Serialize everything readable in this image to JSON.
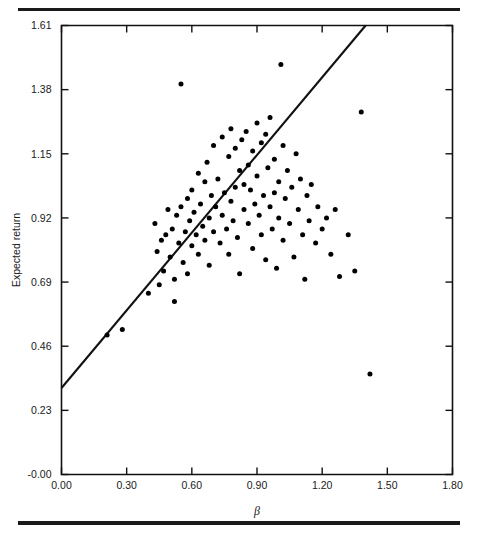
{
  "figure": {
    "background": "#ffffff",
    "ink_color": "#111111",
    "rules": {
      "top_label": "top-horizontal-rule",
      "bottom_label": "bottom-horizontal-rule"
    }
  },
  "chart_data": {
    "type": "scatter",
    "title": "",
    "subtitle": "",
    "xlabel": "β",
    "ylabel": "Expected return",
    "xlim": [
      0.0,
      1.8
    ],
    "ylim": [
      0.0,
      1.61
    ],
    "grid": false,
    "legend": null,
    "xticks": [
      0.0,
      0.3,
      0.6,
      0.9,
      1.2,
      1.5,
      1.8
    ],
    "xticklabels": [
      "0.00",
      "0.30",
      "0.60",
      "0.90",
      "1.20",
      "1.50",
      "1.80"
    ],
    "yticks": [
      0.0,
      0.23,
      0.46,
      0.69,
      0.92,
      1.15,
      1.38,
      1.61
    ],
    "yticklabels": [
      "-0.00",
      "0.23",
      "0.46",
      "0.69",
      "0.92",
      "1.15",
      "1.38",
      "1.61"
    ],
    "marker": {
      "shape": "circle",
      "color": "#000000",
      "size_px": 5
    },
    "fit_line": {
      "name": "security-market-line",
      "color": "#111111",
      "x_start": 0.0,
      "y_start": 0.31,
      "x_end": 1.4,
      "y_end": 1.61,
      "slope": 0.929,
      "intercept": 0.31
    },
    "series": [
      {
        "name": "securities",
        "n_points": 110,
        "points": [
          [
            0.21,
            0.5
          ],
          [
            0.28,
            0.52
          ],
          [
            0.4,
            0.65
          ],
          [
            0.43,
            0.9
          ],
          [
            0.44,
            0.8
          ],
          [
            0.46,
            0.84
          ],
          [
            0.47,
            0.73
          ],
          [
            0.48,
            0.86
          ],
          [
            0.49,
            0.95
          ],
          [
            0.5,
            0.78
          ],
          [
            0.51,
            0.88
          ],
          [
            0.52,
            0.7
          ],
          [
            0.53,
            0.93
          ],
          [
            0.54,
            0.83
          ],
          [
            0.55,
            1.4
          ],
          [
            0.55,
            0.96
          ],
          [
            0.56,
            0.76
          ],
          [
            0.57,
            0.87
          ],
          [
            0.58,
            0.99
          ],
          [
            0.58,
            0.72
          ],
          [
            0.59,
            0.91
          ],
          [
            0.6,
            1.02
          ],
          [
            0.6,
            0.82
          ],
          [
            0.61,
            0.94
          ],
          [
            0.62,
            0.86
          ],
          [
            0.63,
            1.08
          ],
          [
            0.63,
            0.79
          ],
          [
            0.64,
            0.97
          ],
          [
            0.65,
            0.89
          ],
          [
            0.66,
            1.05
          ],
          [
            0.66,
            0.84
          ],
          [
            0.67,
            1.12
          ],
          [
            0.68,
            0.92
          ],
          [
            0.68,
            0.75
          ],
          [
            0.69,
            1.0
          ],
          [
            0.7,
            1.18
          ],
          [
            0.7,
            0.87
          ],
          [
            0.71,
            0.96
          ],
          [
            0.72,
            1.06
          ],
          [
            0.73,
            0.83
          ],
          [
            0.74,
            1.21
          ],
          [
            0.74,
            0.93
          ],
          [
            0.75,
            1.01
          ],
          [
            0.76,
            0.88
          ],
          [
            0.77,
            1.14
          ],
          [
            0.77,
            0.79
          ],
          [
            0.78,
            1.24
          ],
          [
            0.78,
            0.98
          ],
          [
            0.79,
            0.91
          ],
          [
            0.8,
            1.17
          ],
          [
            0.8,
            1.03
          ],
          [
            0.81,
            0.85
          ],
          [
            0.82,
            1.09
          ],
          [
            0.82,
            0.72
          ],
          [
            0.83,
            1.2
          ],
          [
            0.84,
            0.95
          ],
          [
            0.84,
            1.04
          ],
          [
            0.85,
            1.23
          ],
          [
            0.86,
            0.9
          ],
          [
            0.86,
            1.11
          ],
          [
            0.87,
            1.02
          ],
          [
            0.88,
            0.81
          ],
          [
            0.88,
            1.16
          ],
          [
            0.89,
            0.97
          ],
          [
            0.9,
            1.26
          ],
          [
            0.9,
            1.07
          ],
          [
            0.91,
            0.93
          ],
          [
            0.92,
            1.19
          ],
          [
            0.92,
            0.86
          ],
          [
            0.93,
            1.0
          ],
          [
            0.94,
            1.22
          ],
          [
            0.94,
            0.77
          ],
          [
            0.95,
            1.1
          ],
          [
            0.96,
            0.96
          ],
          [
            0.96,
            1.28
          ],
          [
            0.97,
            0.88
          ],
          [
            0.98,
            1.13
          ],
          [
            0.98,
            1.01
          ],
          [
            0.99,
            0.74
          ],
          [
            1.0,
            1.05
          ],
          [
            1.0,
            0.92
          ],
          [
            1.01,
            1.47
          ],
          [
            1.02,
            1.18
          ],
          [
            1.02,
            0.84
          ],
          [
            1.03,
            0.99
          ],
          [
            1.04,
            1.09
          ],
          [
            1.05,
            0.9
          ],
          [
            1.06,
            1.03
          ],
          [
            1.07,
            0.78
          ],
          [
            1.08,
            1.15
          ],
          [
            1.09,
            0.95
          ],
          [
            1.1,
            1.06
          ],
          [
            1.11,
            0.86
          ],
          [
            1.12,
            0.7
          ],
          [
            1.13,
            1.0
          ],
          [
            1.14,
            0.91
          ],
          [
            1.15,
            1.04
          ],
          [
            1.17,
            0.83
          ],
          [
            1.18,
            0.96
          ],
          [
            1.2,
            0.88
          ],
          [
            1.22,
            0.92
          ],
          [
            1.24,
            0.79
          ],
          [
            1.26,
            0.95
          ],
          [
            1.28,
            0.71
          ],
          [
            1.32,
            0.86
          ],
          [
            1.35,
            0.73
          ],
          [
            1.38,
            1.3
          ],
          [
            1.42,
            0.36
          ],
          [
            0.45,
            0.68
          ],
          [
            0.52,
            0.62
          ]
        ]
      }
    ]
  }
}
